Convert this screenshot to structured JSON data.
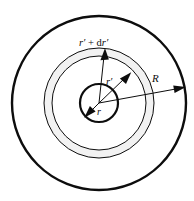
{
  "figure": {
    "type": "geometry-diagram",
    "background_color": "#ffffff",
    "stroke_color": "#0d0d0d",
    "annulus_fill": "#f2f2f2",
    "center": {
      "x": 99,
      "y": 103
    },
    "circles": [
      {
        "name": "outer-boundary-circle",
        "radius": 87,
        "stroke_width": 2.4
      },
      {
        "name": "shell-outer-circle",
        "radius": 55,
        "stroke_width": 1.0
      },
      {
        "name": "shell-inner-circle",
        "radius": 47,
        "stroke_width": 1.0
      },
      {
        "name": "core-circle",
        "radius": 19,
        "stroke_width": 2.2
      }
    ],
    "labels": {
      "shell_outer": {
        "base": "r",
        "prime": "′",
        "plus": " + ",
        "d": "d",
        "base2": "r",
        "prime2": "′"
      },
      "shell_outer_text": "r′ + dr′",
      "shell_inner_text": "r′",
      "core_text": "r",
      "boundary_text": "R"
    },
    "arrows": [
      {
        "name": "shell-outer-radius-arrow",
        "label": "r′ + dr′",
        "direction": "up",
        "from_radius": 0,
        "to_radius": 55
      },
      {
        "name": "shell-inner-radius-arrow",
        "label": "r′",
        "direction": "upper-right",
        "from_radius": 0,
        "to_radius": 47
      },
      {
        "name": "core-radius-arrow",
        "label": "r",
        "direction": "lower-left",
        "from_radius": 0,
        "to_radius": 19
      },
      {
        "name": "boundary-radius-arrow",
        "label": "R",
        "direction": "right",
        "from_radius": 0,
        "to_radius": 87
      }
    ]
  }
}
